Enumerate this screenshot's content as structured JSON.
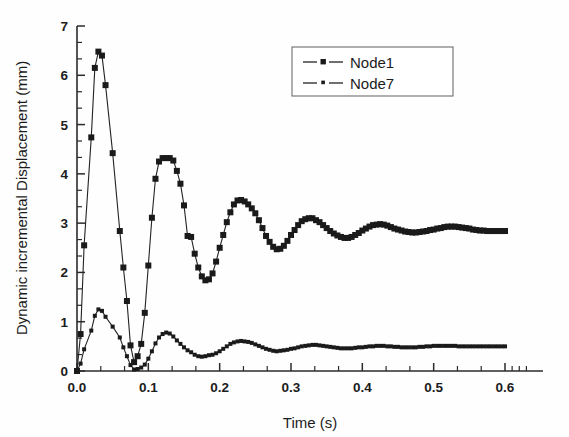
{
  "chart_data": {
    "type": "line",
    "title": "",
    "xlabel": "Time (s)",
    "ylabel": "Dynamic incremental Displacement (mm)",
    "xlim": [
      0.0,
      0.6
    ],
    "ylim": [
      0,
      7
    ],
    "xticks": [
      "0.0",
      "0.1",
      "0.2",
      "0.3",
      "0.4",
      "0.5",
      "0.6"
    ],
    "xtick_values": [
      0.0,
      0.1,
      0.2,
      0.3,
      0.4,
      0.5,
      0.6
    ],
    "yticks": [
      "0",
      "1",
      "2",
      "3",
      "4",
      "5",
      "6",
      "7"
    ],
    "ytick_values": [
      0,
      1,
      2,
      3,
      4,
      5,
      6,
      7
    ],
    "x_minor_per_interval": 2,
    "y_minor_per_interval": 2,
    "grid": false,
    "legend_position": "top-right",
    "marker_shape": "square",
    "series": [
      {
        "name": "Node1",
        "marker": "square",
        "marker_size": 3.0,
        "x": [
          0.0,
          0.005,
          0.01,
          0.02,
          0.025,
          0.03,
          0.035,
          0.04,
          0.05,
          0.06,
          0.065,
          0.07,
          0.075,
          0.08,
          0.085,
          0.09,
          0.095,
          0.1,
          0.105,
          0.11,
          0.115,
          0.12,
          0.125,
          0.13,
          0.135,
          0.14,
          0.145,
          0.15,
          0.155,
          0.16,
          0.165,
          0.17,
          0.175,
          0.18,
          0.185,
          0.19,
          0.195,
          0.2,
          0.205,
          0.21,
          0.215,
          0.22,
          0.225,
          0.23,
          0.235,
          0.24,
          0.245,
          0.25,
          0.255,
          0.26,
          0.265,
          0.27,
          0.275,
          0.28,
          0.285,
          0.29,
          0.295,
          0.3,
          0.305,
          0.31,
          0.315,
          0.32,
          0.325,
          0.33,
          0.335,
          0.34,
          0.345,
          0.35,
          0.355,
          0.36,
          0.365,
          0.37,
          0.375,
          0.38,
          0.385,
          0.39,
          0.395,
          0.4,
          0.405,
          0.41,
          0.415,
          0.42,
          0.425,
          0.43,
          0.435,
          0.44,
          0.445,
          0.45,
          0.455,
          0.46,
          0.465,
          0.47,
          0.475,
          0.48,
          0.485,
          0.49,
          0.495,
          0.5,
          0.505,
          0.51,
          0.515,
          0.52,
          0.525,
          0.53,
          0.535,
          0.54,
          0.545,
          0.55,
          0.555,
          0.56,
          0.565,
          0.57,
          0.575,
          0.58,
          0.585,
          0.59,
          0.595,
          0.6
        ],
        "y": [
          0.0,
          0.75,
          2.55,
          4.74,
          6.15,
          6.48,
          6.4,
          5.8,
          4.42,
          2.84,
          2.1,
          1.42,
          0.52,
          0.18,
          0.3,
          0.55,
          1.18,
          2.14,
          3.11,
          3.9,
          4.25,
          4.32,
          4.32,
          4.32,
          4.27,
          4.06,
          3.8,
          3.36,
          2.74,
          2.72,
          2.38,
          2.1,
          1.92,
          1.84,
          1.86,
          1.98,
          2.22,
          2.5,
          2.76,
          3.02,
          3.22,
          3.38,
          3.46,
          3.47,
          3.44,
          3.38,
          3.3,
          3.2,
          3.06,
          2.9,
          2.74,
          2.62,
          2.52,
          2.47,
          2.48,
          2.54,
          2.64,
          2.76,
          2.86,
          2.96,
          3.04,
          3.08,
          3.1,
          3.1,
          3.06,
          3.02,
          2.96,
          2.9,
          2.84,
          2.79,
          2.75,
          2.72,
          2.7,
          2.7,
          2.72,
          2.76,
          2.8,
          2.85,
          2.89,
          2.93,
          2.96,
          2.97,
          2.98,
          2.97,
          2.95,
          2.92,
          2.89,
          2.87,
          2.85,
          2.83,
          2.82,
          2.81,
          2.81,
          2.82,
          2.83,
          2.84,
          2.86,
          2.87,
          2.89,
          2.9,
          2.92,
          2.93,
          2.93,
          2.93,
          2.92,
          2.91,
          2.9,
          2.89,
          2.87,
          2.86,
          2.85,
          2.85,
          2.84,
          2.84,
          2.84,
          2.84,
          2.84,
          2.84
        ]
      },
      {
        "name": "Node7",
        "marker": "square",
        "marker_size": 2.0,
        "x": [
          0.0,
          0.005,
          0.01,
          0.02,
          0.025,
          0.03,
          0.035,
          0.04,
          0.05,
          0.06,
          0.065,
          0.07,
          0.075,
          0.08,
          0.085,
          0.09,
          0.095,
          0.1,
          0.105,
          0.11,
          0.115,
          0.12,
          0.125,
          0.13,
          0.135,
          0.14,
          0.145,
          0.15,
          0.155,
          0.16,
          0.165,
          0.17,
          0.175,
          0.18,
          0.185,
          0.19,
          0.195,
          0.2,
          0.205,
          0.21,
          0.215,
          0.22,
          0.225,
          0.23,
          0.235,
          0.24,
          0.245,
          0.25,
          0.255,
          0.26,
          0.265,
          0.27,
          0.275,
          0.28,
          0.285,
          0.29,
          0.295,
          0.3,
          0.305,
          0.31,
          0.315,
          0.32,
          0.325,
          0.33,
          0.335,
          0.34,
          0.345,
          0.35,
          0.355,
          0.36,
          0.365,
          0.37,
          0.375,
          0.38,
          0.385,
          0.39,
          0.395,
          0.4,
          0.405,
          0.41,
          0.415,
          0.42,
          0.425,
          0.43,
          0.435,
          0.44,
          0.445,
          0.45,
          0.455,
          0.46,
          0.465,
          0.47,
          0.475,
          0.48,
          0.485,
          0.49,
          0.495,
          0.5,
          0.505,
          0.51,
          0.515,
          0.52,
          0.525,
          0.53,
          0.535,
          0.54,
          0.545,
          0.55,
          0.555,
          0.56,
          0.565,
          0.57,
          0.575,
          0.58,
          0.585,
          0.59,
          0.595,
          0.6
        ],
        "y": [
          0.0,
          0.15,
          0.44,
          0.82,
          1.12,
          1.25,
          1.22,
          1.1,
          0.9,
          0.68,
          0.48,
          0.3,
          0.12,
          0.03,
          0.04,
          0.07,
          0.13,
          0.25,
          0.4,
          0.56,
          0.68,
          0.75,
          0.78,
          0.76,
          0.7,
          0.62,
          0.55,
          0.48,
          0.42,
          0.38,
          0.33,
          0.3,
          0.29,
          0.3,
          0.32,
          0.33,
          0.36,
          0.4,
          0.45,
          0.5,
          0.55,
          0.58,
          0.6,
          0.61,
          0.6,
          0.59,
          0.57,
          0.54,
          0.51,
          0.48,
          0.45,
          0.43,
          0.41,
          0.4,
          0.41,
          0.42,
          0.43,
          0.45,
          0.46,
          0.48,
          0.5,
          0.51,
          0.52,
          0.53,
          0.53,
          0.52,
          0.51,
          0.5,
          0.49,
          0.48,
          0.47,
          0.46,
          0.46,
          0.46,
          0.46,
          0.47,
          0.48,
          0.48,
          0.49,
          0.5,
          0.5,
          0.51,
          0.51,
          0.51,
          0.5,
          0.5,
          0.49,
          0.49,
          0.48,
          0.48,
          0.48,
          0.48,
          0.48,
          0.49,
          0.49,
          0.5,
          0.5,
          0.51,
          0.51,
          0.51,
          0.51,
          0.51,
          0.51,
          0.51,
          0.5,
          0.5,
          0.5,
          0.5,
          0.5,
          0.5,
          0.5,
          0.5,
          0.5,
          0.5,
          0.5,
          0.5,
          0.5,
          0.5
        ]
      }
    ]
  },
  "legend": {
    "entries": [
      {
        "label": "Node1"
      },
      {
        "label": "Node7"
      }
    ]
  },
  "axes": {
    "x_title": "Time (s)",
    "y_title": "Dynamic incremental Displacement (mm)"
  }
}
